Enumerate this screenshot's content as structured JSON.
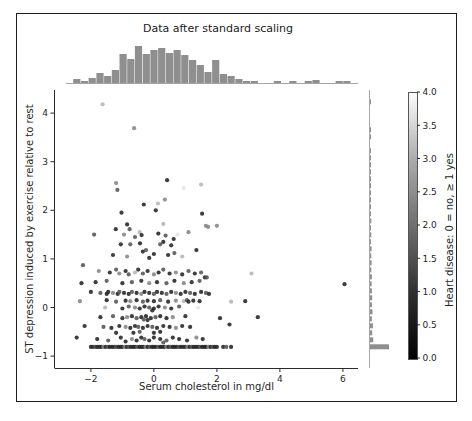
{
  "chart_data": {
    "type": "scatter",
    "title": "Data after standard scaling",
    "xlabel": "Serum cholesterol in mg/dl",
    "ylabel": "ST depression induced by exercise relative to rest",
    "xlim": [
      -3.14,
      6.48
    ],
    "ylim": [
      -1.245,
      4.475
    ],
    "x_ticks": [
      -2,
      0,
      2,
      4,
      6
    ],
    "y_ticks": [
      -1,
      0,
      1,
      2,
      3,
      4
    ],
    "grid": false,
    "legend": "none",
    "colorbar": {
      "label": "Heart disease: 0 = no, ≥ 1 yes",
      "vmin": 0.0,
      "vmax": 4.0,
      "ticks": [
        0.0,
        0.5,
        1.0,
        1.5,
        2.0,
        2.5,
        3.0,
        3.5,
        4.0
      ],
      "cmap": "gray"
    },
    "colors": {
      "histogram": "#8f8f8f",
      "axis": "#2b2b2b",
      "point_dark": "#232323",
      "point_light": "#e6e6e6"
    },
    "top_histogram": {
      "bin_start": -2.57,
      "bin_width": 0.245,
      "counts": [
        4,
        2,
        5,
        10,
        7,
        13,
        29,
        24,
        37,
        29,
        33,
        35,
        30,
        33,
        28,
        23,
        18,
        11,
        23,
        9,
        7,
        4,
        2,
        2,
        0,
        0,
        2,
        0,
        2,
        0,
        2,
        3,
        0,
        0,
        2,
        2
      ]
    },
    "right_histogram": {
      "bin_start": -0.88,
      "bin_height": 0.144,
      "counts": [
        60,
        10,
        7,
        9,
        6,
        8,
        6,
        7,
        6,
        5,
        6,
        4,
        5,
        4,
        5,
        3,
        4,
        3,
        4,
        3,
        3,
        2,
        3,
        2,
        2,
        2,
        1,
        2,
        1,
        0,
        1,
        1,
        0,
        0,
        0,
        1
      ]
    },
    "points": [
      [
        -1.63,
        4.18,
        3
      ],
      [
        -0.63,
        3.69,
        2
      ],
      [
        0.42,
        2.62,
        0
      ],
      [
        0.95,
        2.46,
        4
      ],
      [
        1.5,
        2.53,
        3
      ],
      [
        -1.2,
        2.56,
        2
      ],
      [
        -0.32,
        2.12,
        0
      ],
      [
        0.13,
        2.14,
        3
      ],
      [
        -1.16,
        2.42,
        1
      ],
      [
        0.35,
        2.22,
        2
      ],
      [
        0.06,
        2.0,
        0
      ],
      [
        -1.03,
        1.95,
        0
      ],
      [
        1.53,
        1.93,
        0
      ],
      [
        -0.85,
        1.71,
        0
      ],
      [
        -1.21,
        1.61,
        0
      ],
      [
        -0.77,
        1.61,
        1
      ],
      [
        1.65,
        1.68,
        2
      ],
      [
        1.72,
        1.66,
        2
      ],
      [
        0.3,
        1.72,
        3
      ],
      [
        2.0,
        1.68,
        2
      ],
      [
        -1.9,
        1.5,
        1
      ],
      [
        -0.95,
        1.5,
        2
      ],
      [
        -0.45,
        1.55,
        3
      ],
      [
        -0.39,
        1.49,
        0
      ],
      [
        0.14,
        1.52,
        0
      ],
      [
        0.37,
        1.48,
        1
      ],
      [
        0.63,
        1.41,
        0
      ],
      [
        0.75,
        1.5,
        4
      ],
      [
        1.1,
        1.55,
        2
      ],
      [
        -0.44,
        1.32,
        0
      ],
      [
        -1.05,
        1.3,
        0
      ],
      [
        -0.75,
        1.3,
        1
      ],
      [
        0.2,
        1.3,
        1
      ],
      [
        0.3,
        1.35,
        0
      ],
      [
        0.55,
        1.28,
        0
      ],
      [
        -0.6,
        1.45,
        1
      ],
      [
        -0.35,
        1.15,
        0
      ],
      [
        -0.25,
        1.18,
        1
      ],
      [
        0.0,
        1.1,
        0
      ],
      [
        -1.3,
        1.08,
        0
      ],
      [
        0.65,
        1.12,
        1
      ],
      [
        1.35,
        1.18,
        0
      ],
      [
        -0.85,
        1.05,
        2
      ],
      [
        0.9,
        1.05,
        3
      ],
      [
        -0.15,
        1.02,
        0
      ],
      [
        0.45,
        1.08,
        0
      ],
      [
        -2.25,
        0.87,
        1
      ],
      [
        -1.75,
        0.75,
        2
      ],
      [
        -1.4,
        0.72,
        0
      ],
      [
        -1.2,
        0.78,
        1
      ],
      [
        -1.1,
        0.7,
        2
      ],
      [
        -0.9,
        0.75,
        0
      ],
      [
        -0.8,
        0.68,
        1
      ],
      [
        -0.6,
        0.72,
        3
      ],
      [
        -0.5,
        0.78,
        0
      ],
      [
        -0.35,
        0.7,
        1
      ],
      [
        -0.2,
        0.75,
        0
      ],
      [
        0.0,
        0.68,
        2
      ],
      [
        0.15,
        0.72,
        0
      ],
      [
        0.3,
        0.78,
        1
      ],
      [
        0.5,
        0.7,
        0
      ],
      [
        0.7,
        0.72,
        2
      ],
      [
        0.9,
        0.68,
        0
      ],
      [
        1.1,
        0.75,
        1
      ],
      [
        1.3,
        0.7,
        0
      ],
      [
        1.5,
        0.72,
        1
      ],
      [
        3.1,
        0.7,
        3
      ],
      [
        6.05,
        0.48,
        0
      ],
      [
        1.62,
        0.62,
        0
      ],
      [
        1.68,
        0.62,
        1
      ],
      [
        -2.3,
        0.5,
        0
      ],
      [
        -1.85,
        0.52,
        0
      ],
      [
        -1.5,
        0.55,
        1
      ],
      [
        -1.0,
        0.5,
        0
      ],
      [
        -0.7,
        0.52,
        1
      ],
      [
        -0.4,
        0.55,
        0
      ],
      [
        -0.15,
        0.5,
        2
      ],
      [
        0.1,
        0.52,
        0
      ],
      [
        0.4,
        0.5,
        1
      ],
      [
        0.65,
        0.55,
        0
      ],
      [
        0.95,
        0.5,
        2
      ],
      [
        1.2,
        0.52,
        0
      ],
      [
        1.45,
        0.55,
        1
      ],
      [
        -2.0,
        0.32,
        0
      ],
      [
        -1.7,
        0.3,
        1
      ],
      [
        -1.5,
        0.28,
        0
      ],
      [
        -1.45,
        0.32,
        0
      ],
      [
        -1.3,
        0.3,
        2
      ],
      [
        -1.15,
        0.28,
        0
      ],
      [
        -1.1,
        0.32,
        1
      ],
      [
        -0.95,
        0.3,
        0
      ],
      [
        -0.8,
        0.28,
        0
      ],
      [
        -0.7,
        0.32,
        1
      ],
      [
        -0.55,
        0.3,
        0
      ],
      [
        -0.4,
        0.28,
        2
      ],
      [
        -0.3,
        0.32,
        0
      ],
      [
        -0.15,
        0.3,
        0
      ],
      [
        0.0,
        0.28,
        1
      ],
      [
        0.1,
        0.32,
        0
      ],
      [
        0.25,
        0.3,
        0
      ],
      [
        0.4,
        0.28,
        1
      ],
      [
        0.55,
        0.32,
        0
      ],
      [
        0.7,
        0.3,
        2
      ],
      [
        0.85,
        0.28,
        0
      ],
      [
        1.0,
        0.32,
        0
      ],
      [
        1.15,
        0.3,
        1
      ],
      [
        1.3,
        0.28,
        0
      ],
      [
        1.5,
        0.32,
        0
      ],
      [
        1.65,
        0.3,
        1
      ],
      [
        1.75,
        0.28,
        0
      ],
      [
        -2.35,
        0.13,
        2
      ],
      [
        -1.5,
        0.15,
        0
      ],
      [
        -1.2,
        0.12,
        1
      ],
      [
        -0.9,
        0.14,
        0
      ],
      [
        -0.75,
        0.13,
        2
      ],
      [
        -0.55,
        0.15,
        0
      ],
      [
        -0.35,
        0.12,
        1
      ],
      [
        -0.2,
        0.14,
        0
      ],
      [
        0.0,
        0.13,
        0
      ],
      [
        0.2,
        0.15,
        1
      ],
      [
        0.45,
        0.12,
        0
      ],
      [
        0.7,
        0.14,
        2
      ],
      [
        0.95,
        0.13,
        3
      ],
      [
        1.05,
        0.15,
        1
      ],
      [
        1.1,
        0.12,
        0
      ],
      [
        1.25,
        0.14,
        0
      ],
      [
        1.45,
        0.13,
        0
      ],
      [
        2.45,
        0.12,
        3
      ],
      [
        2.9,
        0.13,
        0
      ],
      [
        -1.55,
        0.0,
        3
      ],
      [
        -1.0,
        -0.02,
        0
      ],
      [
        -0.8,
        0.02,
        1
      ],
      [
        -0.6,
        0.0,
        2
      ],
      [
        -0.45,
        -0.02,
        0
      ],
      [
        -0.3,
        0.02,
        0
      ],
      [
        -0.15,
        0.0,
        1
      ],
      [
        0.0,
        -0.02,
        0
      ],
      [
        0.15,
        0.02,
        0
      ],
      [
        0.35,
        0.0,
        2
      ],
      [
        0.55,
        -0.02,
        0
      ],
      [
        0.8,
        0.02,
        1
      ],
      [
        1.4,
        0.0,
        4
      ],
      [
        -0.05,
        -0.06,
        0
      ],
      [
        -1.7,
        -0.2,
        0
      ],
      [
        -1.3,
        -0.18,
        1
      ],
      [
        -1.0,
        -0.22,
        0
      ],
      [
        -0.85,
        -0.2,
        2
      ],
      [
        -0.7,
        -0.18,
        0
      ],
      [
        -0.55,
        -0.22,
        1
      ],
      [
        -0.4,
        -0.2,
        0
      ],
      [
        -0.25,
        -0.18,
        0
      ],
      [
        -0.1,
        -0.22,
        0
      ],
      [
        0.05,
        -0.2,
        1
      ],
      [
        0.2,
        -0.18,
        0
      ],
      [
        0.4,
        -0.22,
        0
      ],
      [
        0.6,
        -0.2,
        2
      ],
      [
        1.0,
        -0.18,
        0
      ],
      [
        2.1,
        -0.22,
        0
      ],
      [
        3.3,
        -0.2,
        0
      ],
      [
        -0.2,
        -0.26,
        0
      ],
      [
        -0.32,
        -0.25,
        1
      ],
      [
        -2.2,
        -0.38,
        0
      ],
      [
        -1.6,
        -0.4,
        1
      ],
      [
        -1.35,
        -0.42,
        0
      ],
      [
        -1.1,
        -0.38,
        0
      ],
      [
        -0.9,
        -0.4,
        2
      ],
      [
        -0.75,
        -0.42,
        0
      ],
      [
        -0.6,
        -0.38,
        0
      ],
      [
        -0.5,
        -0.4,
        1
      ],
      [
        -0.35,
        -0.42,
        0
      ],
      [
        -0.2,
        -0.38,
        0
      ],
      [
        -0.05,
        -0.4,
        1
      ],
      [
        0.1,
        -0.42,
        0
      ],
      [
        0.3,
        -0.38,
        0
      ],
      [
        0.5,
        -0.4,
        0
      ],
      [
        0.7,
        -0.42,
        2
      ],
      [
        0.9,
        -0.38,
        0
      ],
      [
        1.15,
        -0.4,
        0
      ],
      [
        2.4,
        -0.35,
        0
      ],
      [
        -0.45,
        -0.5,
        1
      ],
      [
        0.0,
        -0.52,
        0
      ],
      [
        0.2,
        -0.5,
        0
      ],
      [
        -0.65,
        -0.52,
        0
      ],
      [
        -1.2,
        -0.52,
        0
      ],
      [
        -2.45,
        -0.62,
        0
      ],
      [
        -1.8,
        -0.65,
        0
      ],
      [
        -1.45,
        -0.68,
        1
      ],
      [
        -1.05,
        -0.62,
        0
      ],
      [
        -0.7,
        -0.65,
        2
      ],
      [
        -0.55,
        -0.68,
        0
      ],
      [
        -0.4,
        -0.62,
        0
      ],
      [
        -0.3,
        -0.65,
        1
      ],
      [
        -0.15,
        -0.68,
        0
      ],
      [
        0.0,
        -0.62,
        0
      ],
      [
        0.2,
        -0.65,
        0
      ],
      [
        0.4,
        -0.68,
        1
      ],
      [
        0.6,
        -0.62,
        0
      ],
      [
        0.8,
        -0.65,
        0
      ],
      [
        1.05,
        -0.68,
        0
      ],
      [
        1.35,
        -0.62,
        2
      ],
      [
        1.55,
        -0.65,
        0
      ],
      [
        -0.9,
        -0.7,
        0
      ],
      [
        0.3,
        -0.72,
        1
      ],
      [
        -2.0,
        -0.81,
        0
      ],
      [
        -1.93,
        -0.81,
        0
      ],
      [
        -1.86,
        -0.81,
        1
      ],
      [
        -1.8,
        -0.81,
        0
      ],
      [
        -1.73,
        -0.81,
        0
      ],
      [
        -1.66,
        -0.81,
        0
      ],
      [
        -1.6,
        -0.81,
        2
      ],
      [
        -1.53,
        -0.81,
        0
      ],
      [
        -1.46,
        -0.81,
        1
      ],
      [
        -1.4,
        -0.81,
        0
      ],
      [
        -1.33,
        -0.81,
        0
      ],
      [
        -1.26,
        -0.81,
        0
      ],
      [
        -1.2,
        -0.81,
        1
      ],
      [
        -1.13,
        -0.81,
        0
      ],
      [
        -1.06,
        -0.81,
        0
      ],
      [
        -1.0,
        -0.81,
        0
      ],
      [
        -0.93,
        -0.81,
        2
      ],
      [
        -0.86,
        -0.81,
        0
      ],
      [
        -0.8,
        -0.81,
        1
      ],
      [
        -0.73,
        -0.81,
        0
      ],
      [
        -0.66,
        -0.81,
        0
      ],
      [
        -0.6,
        -0.81,
        0
      ],
      [
        -0.53,
        -0.81,
        1
      ],
      [
        -0.46,
        -0.81,
        0
      ],
      [
        -0.4,
        -0.81,
        0
      ],
      [
        -0.33,
        -0.81,
        0
      ],
      [
        -0.26,
        -0.81,
        2
      ],
      [
        -0.2,
        -0.81,
        0
      ],
      [
        -0.13,
        -0.81,
        1
      ],
      [
        -0.06,
        -0.81,
        0
      ],
      [
        0.0,
        -0.81,
        0
      ],
      [
        0.06,
        -0.81,
        0
      ],
      [
        0.13,
        -0.81,
        1
      ],
      [
        0.2,
        -0.81,
        0
      ],
      [
        0.26,
        -0.81,
        0
      ],
      [
        0.33,
        -0.81,
        0
      ],
      [
        0.4,
        -0.81,
        2
      ],
      [
        0.46,
        -0.81,
        0
      ],
      [
        0.53,
        -0.81,
        1
      ],
      [
        0.6,
        -0.81,
        0
      ],
      [
        0.66,
        -0.81,
        0
      ],
      [
        0.73,
        -0.81,
        0
      ],
      [
        0.8,
        -0.81,
        1
      ],
      [
        0.86,
        -0.81,
        0
      ],
      [
        0.93,
        -0.81,
        0
      ],
      [
        1.0,
        -0.81,
        0
      ],
      [
        1.06,
        -0.81,
        2
      ],
      [
        1.13,
        -0.81,
        0
      ],
      [
        1.2,
        -0.81,
        1
      ],
      [
        1.26,
        -0.81,
        0
      ],
      [
        1.33,
        -0.81,
        0
      ],
      [
        1.4,
        -0.81,
        0
      ],
      [
        1.46,
        -0.81,
        1
      ],
      [
        1.53,
        -0.81,
        0
      ],
      [
        1.6,
        -0.81,
        0
      ],
      [
        1.66,
        -0.81,
        0
      ],
      [
        1.73,
        -0.81,
        2
      ],
      [
        1.8,
        -0.81,
        0
      ],
      [
        1.86,
        -0.81,
        1
      ],
      [
        1.93,
        -0.81,
        0
      ],
      [
        2.0,
        -0.81,
        0
      ],
      [
        2.2,
        -0.81,
        0
      ],
      [
        2.3,
        -0.81,
        1
      ],
      [
        2.45,
        -0.81,
        0
      ]
    ]
  }
}
